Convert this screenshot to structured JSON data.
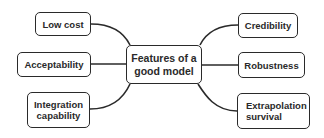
{
  "diagram": {
    "center": {
      "label": "Features of a good model"
    },
    "left_nodes": [
      {
        "label": "Low cost"
      },
      {
        "label": "Acceptability"
      },
      {
        "label": "Integration capability"
      }
    ],
    "right_nodes": [
      {
        "label": "Credibility"
      },
      {
        "label": "Robustness"
      },
      {
        "label": "Extrapolation survival"
      }
    ],
    "colors": {
      "stroke": "#2a2a2a",
      "background": "#ffffff"
    }
  }
}
